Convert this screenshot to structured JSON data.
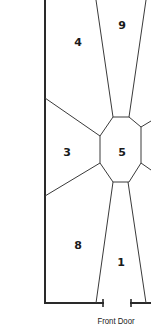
{
  "diagram": {
    "type": "floor-plan",
    "stroke_color": "#2a2a2a",
    "zones": [
      {
        "id": "9",
        "label": "9",
        "x": 122,
        "y": 25
      },
      {
        "id": "4",
        "label": "4",
        "x": 78,
        "y": 42
      },
      {
        "id": "3",
        "label": "3",
        "x": 67,
        "y": 152
      },
      {
        "id": "5",
        "label": "5",
        "x": 122,
        "y": 152
      },
      {
        "id": "8",
        "label": "8",
        "x": 78,
        "y": 245
      },
      {
        "id": "1",
        "label": "1",
        "x": 121,
        "y": 262
      }
    ],
    "caption": "Front Door"
  }
}
